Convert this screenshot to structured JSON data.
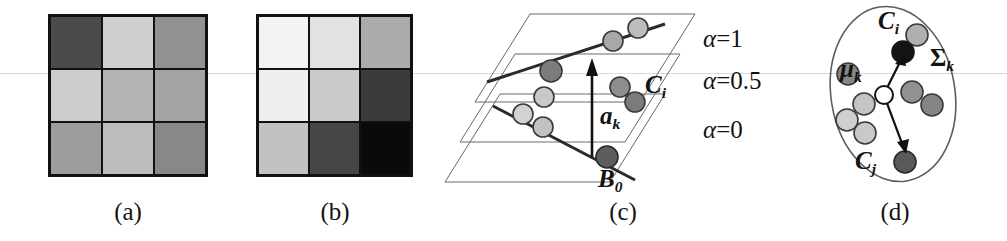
{
  "figure": {
    "background": "#ffffff",
    "scanline_color": "#d8d8d8",
    "scanline_y": 73
  },
  "panels": [
    {
      "id": "a",
      "caption": "(a)",
      "type": "grayscale-grid",
      "rows": 3,
      "cols": 3,
      "cells": [
        [
          "#4b4b4b",
          "#cfcfcf",
          "#919191"
        ],
        [
          "#cdcdcd",
          "#b3b3b3",
          "#a4a4a4"
        ],
        [
          "#9d9d9d",
          "#bcbcbc",
          "#888888"
        ]
      ]
    },
    {
      "id": "b",
      "caption": "(b)",
      "type": "grayscale-grid",
      "rows": 3,
      "cols": 3,
      "cells": [
        [
          "#f3f3f3",
          "#e2e2e2",
          "#ababab"
        ],
        [
          "#efefef",
          "#cacaca",
          "#3b3b3b"
        ],
        [
          "#c2c2c2",
          "#464646",
          "#0a0a0a"
        ]
      ]
    },
    {
      "id": "c",
      "caption": "(c)",
      "type": "stacked-planes",
      "plane_labels": [
        {
          "name": "alpha-1",
          "symbol": "α",
          "eq": "=",
          "value": "1"
        },
        {
          "name": "alpha-0.5",
          "symbol": "α",
          "eq": "=",
          "value": "0.5"
        },
        {
          "name": "alpha-0",
          "symbol": "α",
          "eq": "=",
          "value": "0"
        }
      ],
      "vector_label": {
        "symbol": "a",
        "sub": "k"
      },
      "cluster_label": {
        "symbol": "C",
        "sub": "i"
      },
      "basis_label": {
        "symbol": "B",
        "sub": "0"
      },
      "point_fills": [
        "#b9b9b9",
        "#cfcfcf",
        "#9a9a9a",
        "#6f6f6f",
        "#555555"
      ]
    },
    {
      "id": "d",
      "caption": "(d)",
      "type": "cluster-ellipse",
      "covariance_label": {
        "symbol": "Σ",
        "sub": "k"
      },
      "mean_label": {
        "symbol": "μ",
        "sub": "k"
      },
      "point_i_label": {
        "symbol": "C",
        "sub": "i"
      },
      "point_j_label": {
        "symbol": "C",
        "sub": "j"
      },
      "point_fills": [
        "#cccccc",
        "#bdbdbd",
        "#9b9b9b",
        "#868686",
        "#5e5e5e",
        "#141414"
      ]
    }
  ]
}
